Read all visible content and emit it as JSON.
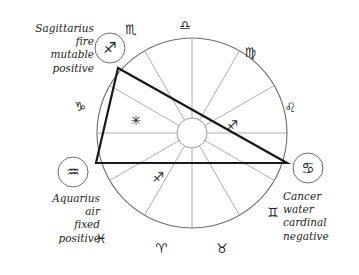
{
  "chart_data": {
    "type": "diagram",
    "wheel": {
      "center": [
        192,
        133
      ],
      "outer_radius": 95,
      "inner_radius": 15,
      "house_count": 12,
      "rim_color": "#6d6e71",
      "spoke_color": "#9a9b9e"
    },
    "outer_glyphs": [
      {
        "name": "scorpio",
        "symbol": "♏",
        "x": 131,
        "y": 29
      },
      {
        "name": "libra",
        "symbol": "♎",
        "x": 185,
        "y": 25
      },
      {
        "name": "virgo",
        "symbol": "♍",
        "x": 250,
        "y": 52
      },
      {
        "name": "leo",
        "symbol": "♌",
        "x": 290,
        "y": 107
      },
      {
        "name": "cancer-rim",
        "symbol": "",
        "x": 0,
        "y": 0
      },
      {
        "name": "gemini",
        "symbol": "♊",
        "x": 273,
        "y": 212
      },
      {
        "name": "taurus",
        "symbol": "♉",
        "x": 222,
        "y": 248
      },
      {
        "name": "aries",
        "symbol": "♈",
        "x": 161,
        "y": 248
      },
      {
        "name": "pisces",
        "symbol": "♓",
        "x": 101,
        "y": 238
      },
      {
        "name": "capricorn",
        "symbol": "♑",
        "x": 80,
        "y": 106
      }
    ],
    "inner_glyphs": [
      {
        "name": "aquarius-inner",
        "symbol": "✳",
        "x": 136,
        "y": 120
      },
      {
        "name": "sagittarius-inner-right",
        "symbol": "♐",
        "x": 232,
        "y": 125
      },
      {
        "name": "sagittarius-inner-left",
        "symbol": "♐",
        "x": 158,
        "y": 177
      }
    ],
    "aspect_triangle": {
      "name": "grand-trine",
      "color": "#1a1a1a",
      "stroke_width": 2.2,
      "vertices": [
        [
          118,
          68
        ],
        [
          96,
          163
        ],
        [
          287,
          163
        ]
      ]
    },
    "markers": [
      {
        "name": "sagittarius",
        "symbol": "♐",
        "circle": {
          "cx": 110,
          "cy": 48,
          "r": 15
        }
      },
      {
        "name": "aquarius",
        "symbol": "♒",
        "circle": {
          "cx": 73,
          "cy": 172,
          "r": 15
        }
      },
      {
        "name": "cancer",
        "symbol": "♋",
        "circle": {
          "cx": 308,
          "cy": 168,
          "r": 15
        }
      }
    ]
  },
  "annotations": {
    "sagittarius": {
      "sign": "Sagittarius",
      "element": "fire",
      "modality": "mutable",
      "polarity": "positive"
    },
    "aquarius": {
      "sign": "Aquarius",
      "element": "air",
      "modality": "fixed",
      "polarity": "positive"
    },
    "cancer": {
      "sign": "Cancer",
      "element": "water",
      "modality": "cardinal",
      "polarity": "negative"
    }
  }
}
